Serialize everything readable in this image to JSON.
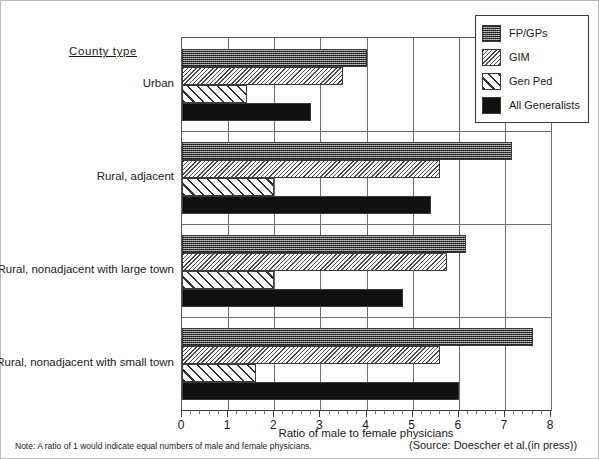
{
  "chart_data": {
    "type": "bar",
    "orientation": "horizontal",
    "title": "",
    "xlabel": "Ratio of male to female physicians",
    "ylabel": "County type",
    "xlim": [
      0,
      8
    ],
    "xticks": [
      0,
      1,
      2,
      3,
      4,
      5,
      6,
      7,
      8
    ],
    "xtick_labels": [
      "0",
      "1",
      "2",
      "3",
      "4",
      "5",
      "6",
      "7",
      "8"
    ],
    "minor_ticks_per_interval": 5,
    "grid": "vertical",
    "legend_position": "top-right",
    "categories": [
      "Urban",
      "Rural, adjacent",
      "Rural, nonadjacent with large town",
      "Rural, nonadjacent with small town"
    ],
    "series": [
      {
        "name": "FP/GPs",
        "pattern": "dark-checker",
        "values": [
          4.0,
          7.15,
          6.15,
          7.6
        ]
      },
      {
        "name": "GIM",
        "pattern": "fine-crosshatch",
        "values": [
          3.5,
          5.6,
          5.75,
          5.6
        ]
      },
      {
        "name": "Gen Ped",
        "pattern": "diagonal-hatch",
        "values": [
          1.4,
          2.0,
          2.0,
          1.6
        ]
      },
      {
        "name": "All Generalists",
        "pattern": "solid-black",
        "values": [
          2.8,
          5.4,
          4.8,
          6.0
        ]
      }
    ],
    "note": "Note: A ratio of 1 would indicate equal numbers of male and female physicians.",
    "source": "(Source: Doescher et al.(in press))"
  },
  "legend": {
    "items": [
      {
        "label": "FP/GPs"
      },
      {
        "label": "GIM"
      },
      {
        "label": "Gen Ped"
      },
      {
        "label": "All Generalists"
      }
    ]
  }
}
